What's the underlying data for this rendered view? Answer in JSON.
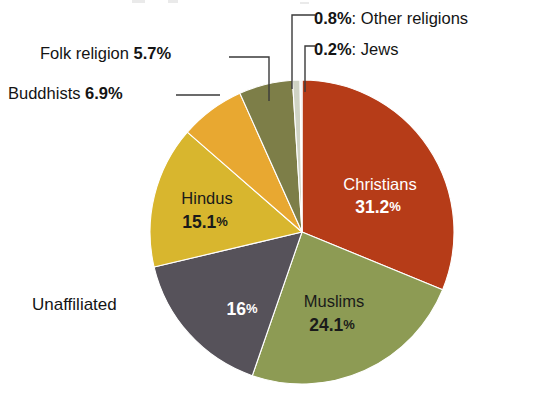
{
  "chart_data": {
    "type": "pie",
    "title": "",
    "subtitle": "",
    "xlabel": "",
    "ylabel": "",
    "legend_position": "none",
    "grid": false,
    "units": "percent",
    "start_angle_deg": 0,
    "direction": "clockwise",
    "categories": [
      "Christians",
      "Muslims",
      "Unaffiliated",
      "Hindus",
      "Buddhists",
      "Folk religion",
      "Other religions",
      "Jews"
    ],
    "values": [
      31.2,
      24.1,
      16.0,
      15.1,
      6.9,
      5.7,
      0.8,
      0.2
    ],
    "slices": [
      {
        "name": "Christians",
        "value": 31.2,
        "value_label": "31.2%",
        "color": "#b63c18",
        "label_placement": "inside",
        "text_color": "#ffffff"
      },
      {
        "name": "Muslims",
        "value": 24.1,
        "value_label": "24.1%",
        "color": "#8d9b54",
        "label_placement": "inside",
        "text_color": "#1a1a1a"
      },
      {
        "name": "Unaffiliated",
        "value": 16.0,
        "value_label": "16%",
        "color": "#56525a",
        "label_placement": "split",
        "text_color": "#ffffff"
      },
      {
        "name": "Hindus",
        "value": 15.1,
        "value_label": "15.1%",
        "color": "#d8b62e",
        "label_placement": "inside",
        "text_color": "#1a1a1a"
      },
      {
        "name": "Buddhists",
        "value": 6.9,
        "value_label": "6.9%",
        "color": "#e8a831",
        "label_placement": "outside",
        "text_color": "#141414"
      },
      {
        "name": "Folk religion",
        "value": 5.7,
        "value_label": "5.7%",
        "color": "#7d7e48",
        "label_placement": "outside",
        "text_color": "#141414"
      },
      {
        "name": "Other religions",
        "value": 0.8,
        "value_label": "0.8%",
        "color": "#cfd3c4",
        "label_placement": "outside",
        "text_color": "#141414"
      },
      {
        "name": "Jews",
        "value": 0.2,
        "value_label": "0.2%",
        "color": "#e9e9e9",
        "label_placement": "outside",
        "text_color": "#141414"
      }
    ]
  },
  "inside_labels": {
    "christians": {
      "name": "Christians",
      "value": "31.2",
      "pct": "%"
    },
    "muslims": {
      "name": "Muslims",
      "value": "24.1",
      "pct": "%"
    },
    "unaffiliated_value": {
      "value": "16",
      "pct": "%"
    },
    "hindus": {
      "name": "Hindus",
      "value": "15.1",
      "pct": "%"
    }
  },
  "outside_labels": {
    "folk": {
      "name": "Folk religion",
      "value": "5.7%"
    },
    "buddhists": {
      "name": "Buddhists",
      "value": "6.9%"
    },
    "unaffiliated": {
      "name": "Unaffiliated"
    },
    "other": {
      "value": "0.8%",
      "sep": ":",
      "name": "Other religions"
    },
    "jews": {
      "value": "0.2%",
      "sep": ":",
      "name": "Jews"
    }
  }
}
